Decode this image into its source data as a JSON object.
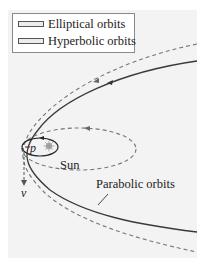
{
  "legend": {
    "items": [
      {
        "label": "Elliptical orbits",
        "swatch": "ellipse-swatch"
      },
      {
        "label": "Hyperbolic orbits",
        "swatch": "hyperbola-swatch"
      }
    ]
  },
  "labels": {
    "sun": "Sun",
    "parabolic": "Parabolic orbits",
    "perihelion": "p",
    "velocity": "v"
  },
  "colors": {
    "panel": "#f3f3f3",
    "solid_curve": "#3a3a3a",
    "dashed_curve": "#777777"
  },
  "diagram": {
    "curves": [
      {
        "name": "parabolic-orbit",
        "style": "solid"
      },
      {
        "name": "hyperbolic-orbit",
        "style": "dashed"
      },
      {
        "name": "elliptical-orbit-large",
        "style": "dashed"
      },
      {
        "name": "elliptical-orbit-small",
        "style": "solid"
      }
    ],
    "arrows": [
      "velocity-arrow-down",
      "orbit-direction-arrows"
    ]
  }
}
